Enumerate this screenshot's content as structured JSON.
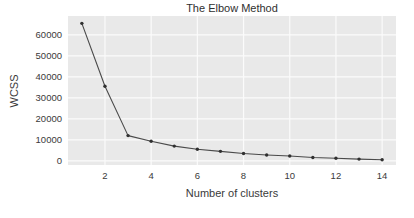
{
  "chart_data": {
    "type": "line",
    "title": "The Elbow Method",
    "xlabel": "Number of clusters",
    "ylabel": "WCSS",
    "x": [
      1,
      2,
      3,
      4,
      5,
      6,
      7,
      8,
      9,
      10,
      11,
      12,
      13,
      14
    ],
    "values": [
      65500,
      35500,
      12000,
      9300,
      7000,
      5500,
      4500,
      3500,
      2800,
      2300,
      1600,
      1200,
      800,
      500
    ],
    "series": [
      {
        "name": "WCSS",
        "values": [
          65500,
          35500,
          12000,
          9300,
          7000,
          5500,
          4500,
          3500,
          2800,
          2300,
          1600,
          1200,
          800,
          500
        ]
      }
    ],
    "xlim": [
      0.4,
      14.6
    ],
    "ylim": [
      -2000,
      69000
    ],
    "xticks": [
      2,
      4,
      6,
      8,
      10,
      12,
      14
    ],
    "xtick_labels": [
      "2",
      "4",
      "6",
      "8",
      "10",
      "12",
      "14"
    ],
    "yticks": [
      0,
      10000,
      20000,
      30000,
      40000,
      50000,
      60000
    ],
    "ytick_labels": [
      "0",
      "10000",
      "20000",
      "30000",
      "40000",
      "50000",
      "60000"
    ],
    "grid": true,
    "legend": "none",
    "marker": "dot",
    "line_color": "#4a4a4a",
    "marker_color": "#303030",
    "plot_bgcolor": "#e9e9e9",
    "grid_color": "#fbfbfb",
    "figure_bgcolor": "#ffffff"
  }
}
